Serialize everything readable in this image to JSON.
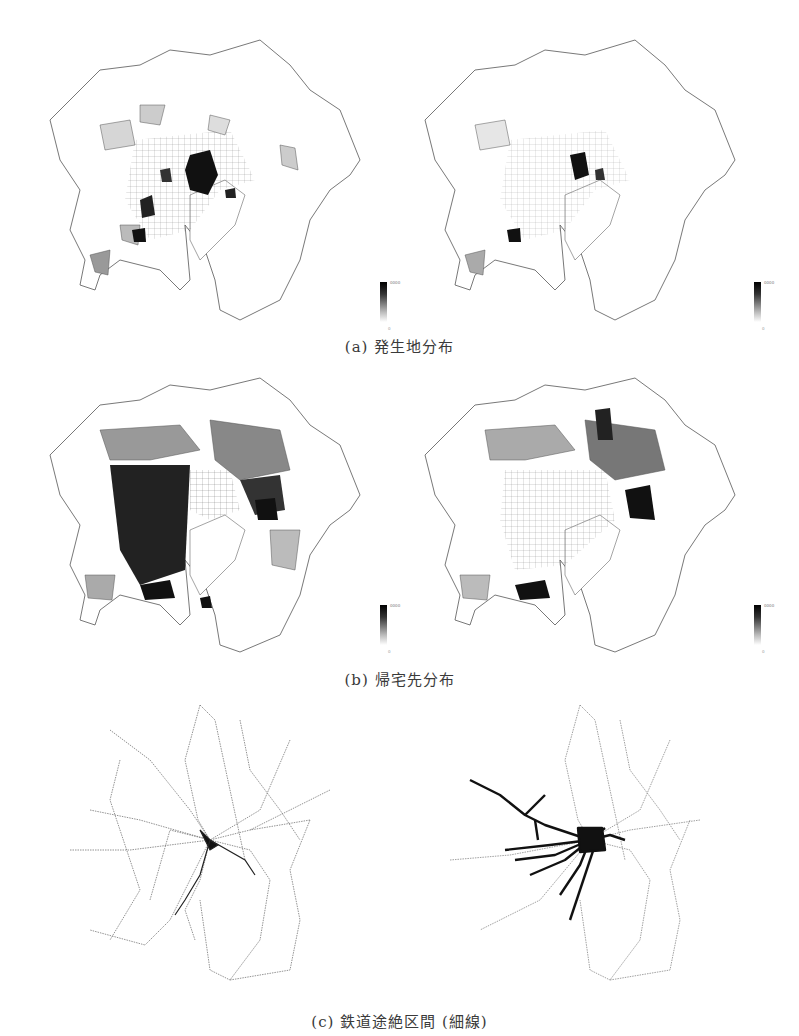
{
  "figure": {
    "rows": [
      {
        "id": "a",
        "caption": "(a) 発生地分布",
        "panels": [
          {
            "side": "left",
            "type": "choropleth",
            "legend": {
              "max": "0000",
              "min": "0"
            }
          },
          {
            "side": "right",
            "type": "choropleth",
            "legend": {
              "max": "0000",
              "min": "0"
            }
          }
        ]
      },
      {
        "id": "b",
        "caption": "(b) 帰宅先分布",
        "panels": [
          {
            "side": "left",
            "type": "choropleth",
            "legend": {
              "max": "0000",
              "min": "0"
            }
          },
          {
            "side": "right",
            "type": "choropleth",
            "legend": {
              "max": "0000",
              "min": "0"
            }
          }
        ]
      },
      {
        "id": "c",
        "caption": "(c) 鉄道途絶区間 (細線)",
        "panels": [
          {
            "side": "left",
            "type": "rail-network"
          },
          {
            "side": "right",
            "type": "rail-network"
          }
        ]
      }
    ],
    "colors": {
      "background": "#ffffff",
      "boundary": "#555555",
      "dense": "#111111",
      "mid": "#888888",
      "light": "#d6d6d6"
    }
  }
}
